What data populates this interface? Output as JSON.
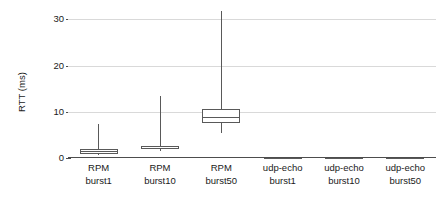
{
  "chart_data": {
    "type": "box",
    "title": "",
    "xlabel": "",
    "ylabel": "RTT (ms)",
    "ylim": [
      0,
      32
    ],
    "yticks": [
      0,
      10,
      20,
      30
    ],
    "ytick_labels": [
      "0",
      "10",
      "20",
      "30"
    ],
    "grid": true,
    "legend": "none",
    "categories": [
      "RPM burst1",
      "RPM burst10",
      "RPM burst50",
      "udp-echo burst1",
      "udp-echo burst10",
      "udp-echo burst50"
    ],
    "category_lines": [
      [
        "RPM",
        "burst1"
      ],
      [
        "RPM",
        "burst10"
      ],
      [
        "RPM",
        "burst50"
      ],
      [
        "udp-echo",
        "burst1"
      ],
      [
        "udp-echo",
        "burst10"
      ],
      [
        "udp-echo",
        "burst50"
      ]
    ],
    "boxes": [
      {
        "label": "RPM burst1",
        "whisker_low": 0.6,
        "q1": 0.9,
        "median": 1.5,
        "q3": 1.9,
        "whisker_high": 7.3
      },
      {
        "label": "RPM burst10",
        "whisker_low": 1.6,
        "q1": 1.9,
        "median": 2.5,
        "q3": 2.7,
        "whisker_high": 13.4
      },
      {
        "label": "RPM burst50",
        "whisker_low": 5.4,
        "q1": 7.5,
        "median": 8.9,
        "q3": 10.5,
        "whisker_high": 31.8
      },
      {
        "label": "udp-echo burst1",
        "whisker_low": 0.0,
        "q1": 0.05,
        "median": 0.1,
        "q3": 0.15,
        "whisker_high": 0.25
      },
      {
        "label": "udp-echo burst10",
        "whisker_low": 0.0,
        "q1": 0.05,
        "median": 0.1,
        "q3": 0.15,
        "whisker_high": 0.25
      },
      {
        "label": "udp-echo burst50",
        "whisker_low": 0.0,
        "q1": 0.05,
        "median": 0.1,
        "q3": 0.15,
        "whisker_high": 0.3
      }
    ],
    "colors": {
      "box_stroke": "#595959",
      "box_fill": "#ffffff",
      "whisker": "#595959",
      "gridline": "#d9d9d9",
      "axis": "#4d4d4d",
      "text": "#1a1a1a"
    }
  }
}
